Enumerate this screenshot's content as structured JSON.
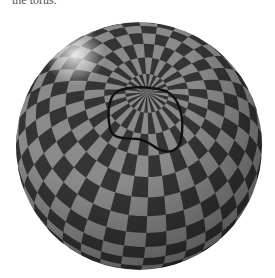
{
  "caption_fragment": "the torus.",
  "figure": {
    "sphere": {
      "cx": 139,
      "cy": 146,
      "rx": 123,
      "ry": 124
    },
    "pole": {
      "x": 158,
      "y": 30
    },
    "colors": {
      "light": "#8a8a8a",
      "dark": "#343434",
      "curve": "#111111",
      "highlight": "#e8e8e8"
    }
  }
}
